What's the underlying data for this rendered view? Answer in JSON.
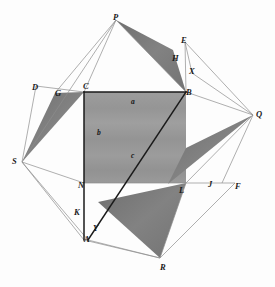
{
  "figure": {
    "background_color": "#fdfdfd",
    "stroke_dark": "#1a1a1a",
    "stroke_light": "#8d8d8d",
    "fill_square": "#9a9a9a",
    "fill_shaded_triangle": "#7c7c7c",
    "width": 275,
    "height": 287
  },
  "vertex_labels": [
    {
      "id": "P",
      "text": "P",
      "x": 113,
      "y": 13
    },
    {
      "id": "E",
      "text": "E",
      "x": 181,
      "y": 36
    },
    {
      "id": "H",
      "text": "H",
      "x": 172,
      "y": 54
    },
    {
      "id": "X",
      "text": "X",
      "x": 189,
      "y": 67
    },
    {
      "id": "D",
      "text": "D",
      "x": 32,
      "y": 83
    },
    {
      "id": "G",
      "text": "G",
      "x": 55,
      "y": 89
    },
    {
      "id": "C",
      "text": "C",
      "x": 83,
      "y": 82
    },
    {
      "id": "B",
      "text": "B",
      "x": 186,
      "y": 88
    },
    {
      "id": "Q",
      "text": "Q",
      "x": 256,
      "y": 110
    },
    {
      "id": "S",
      "text": "S",
      "x": 12,
      "y": 157
    },
    {
      "id": "N",
      "text": "N",
      "x": 78,
      "y": 181
    },
    {
      "id": "L",
      "text": "L",
      "x": 179,
      "y": 186
    },
    {
      "id": "J",
      "text": "J",
      "x": 208,
      "y": 180
    },
    {
      "id": "F",
      "text": "F",
      "x": 235,
      "y": 182
    },
    {
      "id": "K",
      "text": "K",
      "x": 74,
      "y": 208
    },
    {
      "id": "Y",
      "text": "Y",
      "x": 93,
      "y": 224
    },
    {
      "id": "A",
      "text": "A",
      "x": 84,
      "y": 235
    },
    {
      "id": "R",
      "text": "R",
      "x": 160,
      "y": 263
    }
  ],
  "area_labels": [
    {
      "id": "a",
      "text": "a",
      "x": 131,
      "y": 98
    },
    {
      "id": "b",
      "text": "b",
      "x": 97,
      "y": 129
    },
    {
      "id": "c",
      "text": "c",
      "x": 131,
      "y": 152
    }
  ],
  "geometry": {
    "outer_diamond": "116,20 253,115 160,258 22,162",
    "center_square": "84,92 186,92 186,183 84,183",
    "shaded_triangles": [
      "116,20 186,92 170,52",
      "84,92 22,162 55,93",
      "253,115 170,183 186,150",
      "186,183 160,258 100,205"
    ],
    "dark_lines": [
      "84,92 186,92",
      "84,92 84,240",
      "88,240 186,92"
    ],
    "light_lines": [
      "116,20 84,92",
      "116,20 55,93",
      "116,20 186,92",
      "185,42 186,92",
      "185,42 253,115",
      "185,42 192,73",
      "186,92 253,115",
      "253,115 222,183",
      "253,115 186,183",
      "36,86 84,92",
      "36,86 22,162",
      "22,162 84,183",
      "22,162 84,240",
      "22,162 88,240",
      "84,183 186,183",
      "186,183 235,183",
      "235,183 160,258",
      "186,183 160,258",
      "88,240 160,258",
      "84,240 160,258",
      "116,20 22,162",
      "192,73 253,115"
    ]
  }
}
